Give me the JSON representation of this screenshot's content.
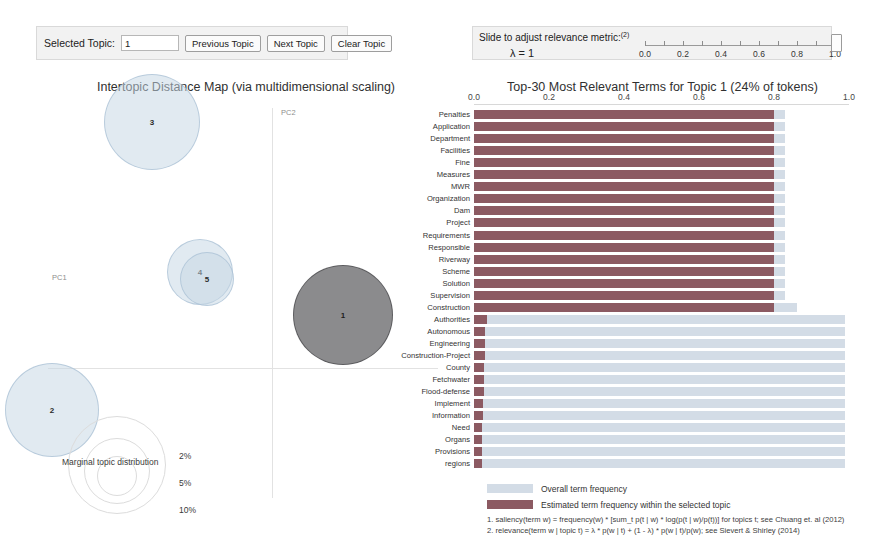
{
  "topic_controls": {
    "selected_topic_label": "Selected Topic:",
    "selected_topic_value": "1",
    "previous_button": "Previous Topic",
    "next_button": "Next Topic",
    "clear_button": "Clear Topic"
  },
  "relevance": {
    "instruction": "Slide to adjust relevance metric:",
    "footnote_marker": "(2)",
    "lambda_text": "λ = 1",
    "ticks": [
      "0.0",
      "0.2",
      "0.4",
      "0.6",
      "0.8",
      "1.0"
    ],
    "handle_value": "1.0"
  },
  "left_panel": {
    "title": "Intertopic Distance Map (via multidimensional scaling)",
    "x_axis_label": "PC1",
    "y_axis_label": "PC2",
    "marginal_label": "Marginal topic distribution",
    "size_legend": [
      "2%",
      "5%",
      "10%"
    ],
    "topics": [
      {
        "id": "3",
        "x": 112,
        "y": 22,
        "r": 48,
        "selected": false
      },
      {
        "id": "4",
        "x": 160,
        "y": 172,
        "r": 33,
        "selected": false
      },
      {
        "id": "5",
        "x": 167,
        "y": 179,
        "r": 27,
        "selected": false
      },
      {
        "id": "1",
        "x": 303,
        "y": 215,
        "r": 50,
        "selected": true
      },
      {
        "id": "2",
        "x": 12,
        "y": 310,
        "r": 47,
        "selected": false
      }
    ]
  },
  "chart_data": {
    "type": "bar",
    "title": "Top-30 Most Relevant Terms for Topic 1 (24% of tokens)",
    "xlabel": "",
    "ylabel": "",
    "xlim": [
      0.0,
      1.0
    ],
    "ticks": [
      "0.0",
      "0.2",
      "0.4",
      "0.6",
      "0.8",
      "1.0"
    ],
    "grid": false,
    "legend_position": "bottom",
    "series": [
      {
        "name": "Overall term frequency",
        "color": "#d3dce6"
      },
      {
        "name": "Estimated term frequency within the selected topic",
        "color": "#8c5a62"
      }
    ],
    "categories": [
      "Penalties",
      "Application",
      "Department",
      "Facilities",
      "Fine",
      "Measures",
      "MWR",
      "Organization",
      "Dam",
      "Project",
      "Requirements",
      "Responsible",
      "Riverway",
      "Scheme",
      "Solution",
      "Supervision",
      "Construction",
      "Authorities",
      "Autonomous",
      "Engineering",
      "Construction-Project",
      "County",
      "Fetchwater",
      "Flood-defense",
      "Implement",
      "Information",
      "Need",
      "Organs",
      "Provisions",
      "regions"
    ],
    "overall": [
      0.83,
      0.83,
      0.83,
      0.83,
      0.83,
      0.83,
      0.83,
      0.83,
      0.83,
      0.83,
      0.83,
      0.83,
      0.83,
      0.83,
      0.83,
      0.83,
      0.86,
      0.99,
      0.99,
      0.99,
      0.99,
      0.99,
      0.99,
      0.99,
      0.99,
      0.99,
      0.99,
      0.99,
      0.99,
      0.99
    ],
    "estimated": [
      0.8,
      0.8,
      0.8,
      0.8,
      0.8,
      0.8,
      0.8,
      0.8,
      0.8,
      0.8,
      0.8,
      0.8,
      0.8,
      0.8,
      0.8,
      0.8,
      0.8,
      0.035,
      0.03,
      0.03,
      0.028,
      0.026,
      0.026,
      0.026,
      0.024,
      0.024,
      0.022,
      0.022,
      0.02,
      0.02
    ]
  },
  "legend": {
    "overall": "Overall term frequency",
    "estimated": "Estimated term frequency within the selected topic"
  },
  "footnotes": {
    "line1": "1. saliency(term w) = frequency(w) * [sum_t p(t | w) * log(p(t | w)/p(t))] for topics t; see Chuang et. al (2012)",
    "line2": "2. relevance(term w | topic t) = λ * p(w | t) + (1 - λ) * p(w | t)/p(w); see Sievert & Shirley (2014)"
  },
  "colors": {
    "bar_overall": "#d3dce6",
    "bar_estimated": "#8c5a62",
    "bubble_fill": "#c5d6e4",
    "bubble_selected": "#6e6e70"
  }
}
